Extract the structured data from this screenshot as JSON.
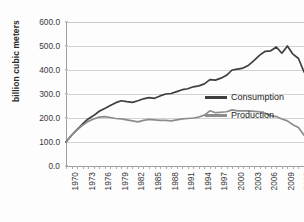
{
  "chart_data": {
    "type": "line",
    "title": "",
    "xlabel": "",
    "ylabel": "billion cubic meters",
    "ylim": [
      0,
      600
    ],
    "ytick_step": 100,
    "ytick_labels": [
      "0.0",
      "100.0",
      "200.0",
      "300.0",
      "400.0",
      "500.0",
      "600.0"
    ],
    "ytick_values": [
      0,
      100,
      200,
      300,
      400,
      500,
      600
    ],
    "grid": true,
    "legend_position": "inside-right",
    "xlim": [
      1970,
      2013
    ],
    "xtick_label_step": 3,
    "xtick_labels": [
      "1970",
      "1973",
      "1976",
      "1979",
      "1982",
      "1985",
      "1988",
      "1991",
      "1994",
      "1997",
      "2000",
      "2003",
      "2006",
      "2009",
      "2012"
    ],
    "x": [
      1970,
      1971,
      1972,
      1973,
      1974,
      1975,
      1976,
      1977,
      1978,
      1979,
      1980,
      1981,
      1982,
      1983,
      1984,
      1985,
      1986,
      1987,
      1988,
      1989,
      1990,
      1991,
      1992,
      1993,
      1994,
      1995,
      1996,
      1997,
      1998,
      1999,
      2000,
      2001,
      2002,
      2003,
      2004,
      2005,
      2006,
      2007,
      2008,
      2009,
      2010,
      2011,
      2012,
      2013
    ],
    "series": [
      {
        "name": "Consumption",
        "color": "#3f3f3f",
        "values": [
          100,
          128,
          152,
          175,
          196,
          210,
          228,
          240,
          252,
          264,
          272,
          268,
          265,
          272,
          280,
          285,
          282,
          292,
          300,
          302,
          310,
          318,
          322,
          330,
          334,
          342,
          360,
          358,
          366,
          378,
          400,
          404,
          408,
          420,
          440,
          462,
          478,
          480,
          496,
          470,
          500,
          466,
          448,
          392
        ]
      },
      {
        "name": "Production",
        "color": "#8c8c8c",
        "values": [
          100,
          128,
          150,
          170,
          186,
          196,
          204,
          206,
          202,
          198,
          196,
          192,
          188,
          184,
          190,
          194,
          192,
          190,
          190,
          188,
          192,
          196,
          198,
          200,
          204,
          212,
          230,
          222,
          224,
          226,
          234,
          230,
          230,
          230,
          228,
          226,
          220,
          210,
          206,
          196,
          188,
          172,
          160,
          128
        ]
      }
    ]
  },
  "legend": {
    "items": [
      {
        "label": "Consumption",
        "color": "#3f3f3f"
      },
      {
        "label": "Production",
        "color": "#8c8c8c"
      }
    ]
  }
}
